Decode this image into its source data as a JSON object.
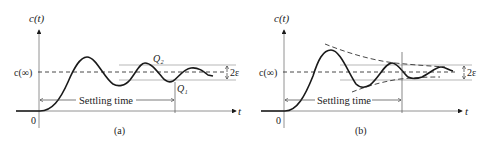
{
  "panels": [
    {
      "id": "a",
      "caption": "(a)",
      "y_axis_label": "c(t)",
      "x_axis_label": "t",
      "origin_label": "0",
      "steady_state_label": "c(∞)",
      "band_label": "2ε",
      "settling_label": "Settling time",
      "points": {
        "q2": "Q₂",
        "q1": "Q₁"
      }
    },
    {
      "id": "b",
      "caption": "(b)",
      "y_axis_label": "c(t)",
      "x_axis_label": "t",
      "origin_label": "0",
      "steady_state_label": "c(∞)",
      "band_label": "2ε",
      "settling_label": "Settling time"
    }
  ],
  "colors": {
    "stroke": "#1a1a1a",
    "band": "#888888",
    "background": "#ffffff"
  }
}
